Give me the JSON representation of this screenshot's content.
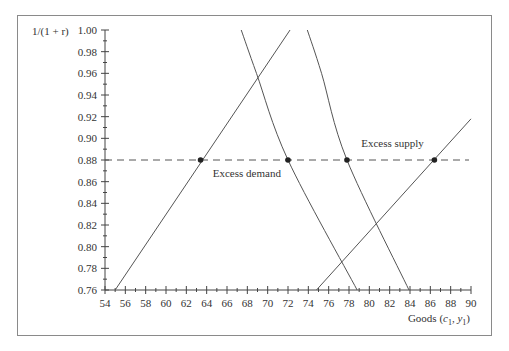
{
  "chart_data": {
    "type": "line",
    "title": "",
    "xlabel": "Goods (c₁, y₁)",
    "ylabel": "1/(1 + r)",
    "xlim": [
      54,
      90
    ],
    "ylim": [
      0.76,
      1.0
    ],
    "x_ticks": [
      "54",
      "56",
      "58",
      "60",
      "62",
      "64",
      "66",
      "68",
      "70",
      "72",
      "74",
      "76",
      "78",
      "80",
      "82",
      "84",
      "86",
      "88",
      "90"
    ],
    "y_ticks": [
      "0.76",
      "0.78",
      "0.80",
      "0.82",
      "0.84",
      "0.86",
      "0.88",
      "0.90",
      "0.92",
      "0.94",
      "0.96",
      "0.98",
      "1.00"
    ],
    "grid": false,
    "series": [
      {
        "name": "line-a",
        "shape": "straight",
        "points": [
          [
            55.0,
            0.76
          ],
          [
            72.2,
            1.0
          ]
        ]
      },
      {
        "name": "curve-b",
        "shape": "convex",
        "points": [
          [
            67.4,
            1.0
          ],
          [
            68.9,
            0.96
          ],
          [
            72.0,
            0.88
          ],
          [
            78.8,
            0.76
          ]
        ]
      },
      {
        "name": "curve-c",
        "shape": "convex",
        "points": [
          [
            73.9,
            1.0
          ],
          [
            75.3,
            0.96
          ],
          [
            77.8,
            0.88
          ],
          [
            83.9,
            0.76
          ]
        ]
      },
      {
        "name": "line-d",
        "shape": "straight",
        "points": [
          [
            74.8,
            0.76
          ],
          [
            90.0,
            0.918
          ]
        ]
      }
    ],
    "reference_line": {
      "type": "horizontal",
      "y": 0.88,
      "style": "dashed",
      "x_from": 54,
      "x_to": 90
    },
    "markers": [
      {
        "x": 63.4,
        "y": 0.88
      },
      {
        "x": 72.0,
        "y": 0.88
      },
      {
        "x": 77.8,
        "y": 0.88
      },
      {
        "x": 86.4,
        "y": 0.88
      }
    ],
    "annotations": [
      {
        "text": "Excess demand",
        "x": 64.6,
        "y": 0.872
      },
      {
        "text": "Excess supply",
        "x": 79.2,
        "y": 0.888
      }
    ]
  }
}
